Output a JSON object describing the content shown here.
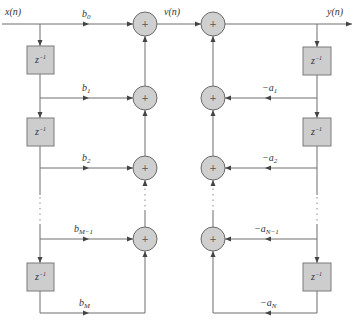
{
  "diagram": {
    "input_label": "x(n)",
    "intermediate_label": "v(n)",
    "output_label": "y(n)",
    "delay_label": "z",
    "delay_exponent": "−1",
    "adder_symbol": "+",
    "feedforward": [
      {
        "base": "b",
        "sub": "0"
      },
      {
        "base": "b",
        "sub": "1"
      },
      {
        "base": "b",
        "sub": "2"
      },
      {
        "base": "b",
        "sub": "M−1"
      },
      {
        "base": "b",
        "sub": "M"
      }
    ],
    "feedback": [
      {
        "base": "−a",
        "sub": "1"
      },
      {
        "base": "−a",
        "sub": "2"
      },
      {
        "base": "−a",
        "sub": "N−1"
      },
      {
        "base": "−a",
        "sub": "N"
      }
    ]
  },
  "colors": {
    "wire": "#6e6e6e",
    "adder_fill": "#cfcfcf",
    "delay_fill": "#cdcdcd",
    "text": "#333333"
  }
}
